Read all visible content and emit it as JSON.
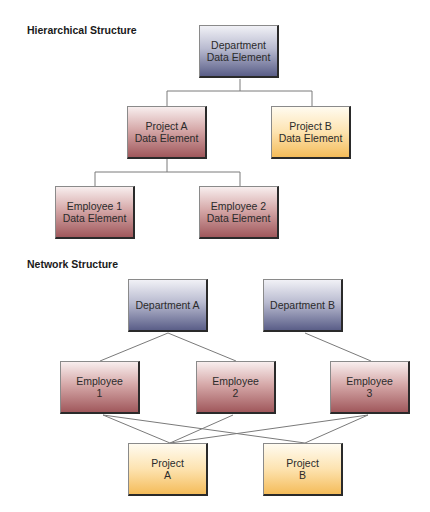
{
  "hierarchical": {
    "title": "Hierarchical Structure",
    "nodes": {
      "department": {
        "line1": "Department",
        "line2": "Data Element",
        "color": "blue"
      },
      "project_a": {
        "line1": "Project A",
        "line2": "Data Element",
        "color": "red"
      },
      "project_b": {
        "line1": "Project B",
        "line2": "Data Element",
        "color": "yellow"
      },
      "employee_1": {
        "line1": "Employee 1",
        "line2": "Data Element",
        "color": "red"
      },
      "employee_2": {
        "line1": "Employee 2",
        "line2": "Data Element",
        "color": "red"
      }
    },
    "edges": [
      [
        "department",
        "project_a"
      ],
      [
        "department",
        "project_b"
      ],
      [
        "project_a",
        "employee_1"
      ],
      [
        "project_a",
        "employee_2"
      ]
    ]
  },
  "network": {
    "title": "Network Structure",
    "nodes": {
      "department_a": {
        "line1": "Department A",
        "line2": "",
        "color": "blue"
      },
      "department_b": {
        "line1": "Department B",
        "line2": "",
        "color": "blue"
      },
      "employee_1": {
        "line1": "Employee",
        "line2": "1",
        "color": "red"
      },
      "employee_2": {
        "line1": "Employee",
        "line2": "2",
        "color": "red"
      },
      "employee_3": {
        "line1": "Employee",
        "line2": "3",
        "color": "red"
      },
      "project_a": {
        "line1": "Project",
        "line2": "A",
        "color": "yellow"
      },
      "project_b": {
        "line1": "Project",
        "line2": "B",
        "color": "yellow"
      }
    },
    "edges": [
      [
        "department_a",
        "employee_1"
      ],
      [
        "department_a",
        "employee_2"
      ],
      [
        "department_b",
        "employee_3"
      ],
      [
        "employee_1",
        "project_a"
      ],
      [
        "employee_1",
        "project_b"
      ],
      [
        "employee_2",
        "project_a"
      ],
      [
        "employee_3",
        "project_a"
      ],
      [
        "employee_3",
        "project_b"
      ]
    ]
  },
  "colors": {
    "blue": "#5a5e88",
    "red": "#a0585c",
    "yellow": "#f4bc5a",
    "edge": "#777777"
  }
}
